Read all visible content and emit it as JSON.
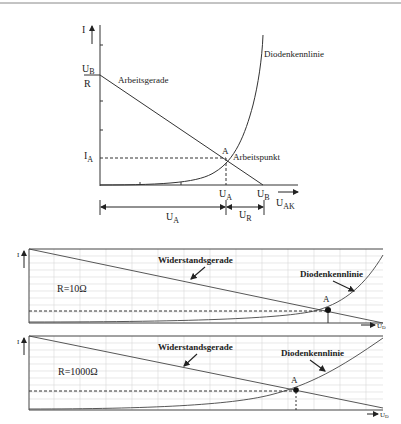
{
  "top_diagram": {
    "y_axis_label": "I",
    "y_tick_top_num": "U",
    "y_tick_top_num_sub": "B",
    "y_tick_top_den": "R",
    "y_tick_ia": "I",
    "y_tick_ia_sub": "A",
    "x_tick_ua": "U",
    "x_tick_ua_sub": "A",
    "x_tick_ub": "U",
    "x_tick_ub_sub": "B",
    "x_axis_label": "U",
    "x_axis_label_sub": "AK",
    "load_line_label": "Arbeitsgerade",
    "diode_curve_label": "Diodenkennlinie",
    "operating_point_letter": "A",
    "operating_point_label": "Arbeitspunkt",
    "span_ua": "U",
    "span_ua_sub": "A",
    "span_ur": "U",
    "span_ur_sub": "R"
  },
  "panel_1": {
    "y_axis_label": "I",
    "x_axis_label": "U",
    "x_axis_label_sub": "D",
    "resistance_label": "R=10Ω",
    "load_line_label": "Widerstandsgerade",
    "diode_curve_label": "Diodenkennlinie",
    "operating_point_letter": "A"
  },
  "panel_2": {
    "y_axis_label": "I",
    "x_axis_label": "U",
    "x_axis_label_sub": "D",
    "resistance_label": "R=1000Ω",
    "load_line_label": "Widerstandsgerade",
    "diode_curve_label": "Diodenkennlinie",
    "operating_point_letter": "A"
  },
  "colors": {
    "line": "#333333",
    "grid": "#cfcfcf",
    "frame": "#444444"
  }
}
